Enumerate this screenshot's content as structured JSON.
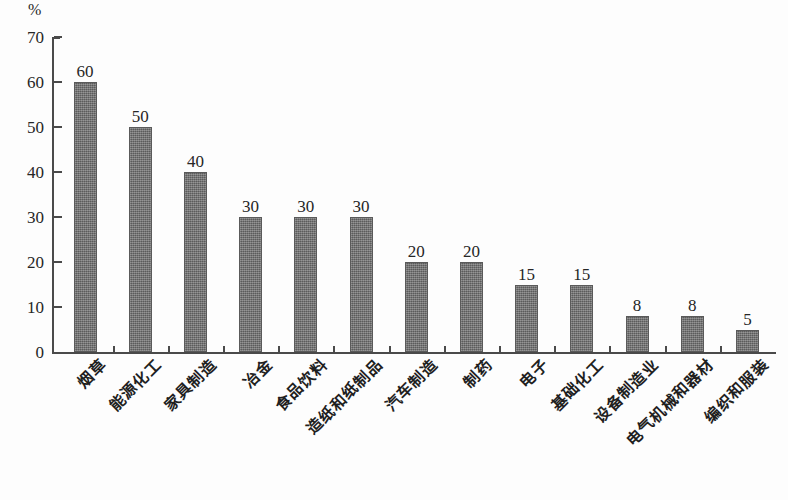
{
  "chart_data": {
    "type": "bar",
    "title": "",
    "subtitle": "",
    "xlabel": "",
    "ylabel": "%",
    "unit_label": "%",
    "ylim": [
      0,
      70
    ],
    "ytick_step": 10,
    "yticks": [
      "0",
      "10",
      "20",
      "30",
      "40",
      "50",
      "60",
      "70"
    ],
    "grid": false,
    "legend": false,
    "legend_position": "none",
    "bar_color": "#6e6e6e",
    "axis_color": "#4a4a4a",
    "background_color": "#ffffff",
    "value_labels_shown": true,
    "categories": [
      "烟草",
      "能源化工",
      "家具制造",
      "冶金",
      "食品饮料",
      "造纸和纸制品",
      "汽车制造",
      "制药",
      "电子",
      "基础化工",
      "设备制造业",
      "电气机械和器材",
      "编织和服装"
    ],
    "values": [
      60,
      50,
      40,
      30,
      30,
      30,
      20,
      20,
      15,
      15,
      8,
      8,
      5
    ],
    "value_labels": [
      "60",
      "50",
      "40",
      "30",
      "30",
      "30",
      "20",
      "20",
      "15",
      "15",
      "8",
      "8",
      "5"
    ]
  }
}
